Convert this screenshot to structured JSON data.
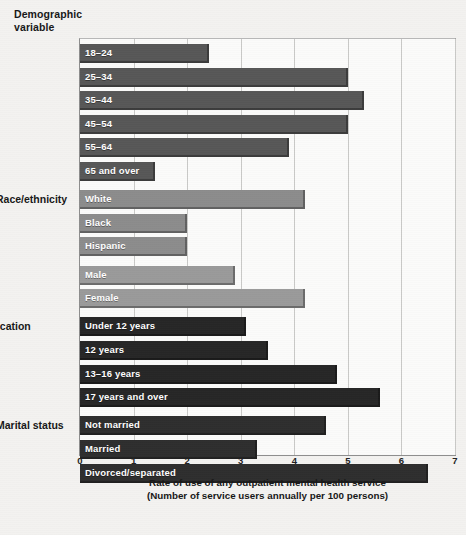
{
  "header": {
    "column_title_line1": "Demographic",
    "column_title_line2": "variable"
  },
  "axis": {
    "title_line1": "Rate of use of any outpatient mental health service",
    "title_line2": "(Number of service users annually per 100 persons)",
    "ticks": [
      "0",
      "1",
      "2",
      "3",
      "4",
      "5",
      "6",
      "7"
    ]
  },
  "groups": [
    {
      "label": "Age"
    },
    {
      "label": "Race/ethnicity"
    },
    {
      "label": "Sex"
    },
    {
      "label": "Education"
    },
    {
      "label": "Marital status"
    }
  ],
  "colors": {
    "age_bar": "#575757",
    "race_bar": "#8c8c8c",
    "sex_bar": "#9a9a9a",
    "education_bar": "#262626",
    "marital_bar": "#2e2e2e",
    "plot_background": "#fbfbfa",
    "page_background": "#f3f2f0",
    "gridline": "#c9c9c7",
    "axis_line": "#8d8d8d",
    "text": "#171717"
  },
  "chart_data": {
    "type": "bar",
    "orientation": "horizontal",
    "title": "",
    "xlabel": "Rate of use of any outpatient mental health service (Number of service users annually per 100 persons)",
    "ylabel": "Demographic variable",
    "xlim": [
      0,
      7
    ],
    "xticks": [
      0,
      1,
      2,
      3,
      4,
      5,
      6,
      7
    ],
    "grid": "vertical",
    "legend": "none",
    "categories": [
      "18–24",
      "25–34",
      "35–44",
      "45–54",
      "55–64",
      "65 and over",
      "White",
      "Black",
      "Hispanic",
      "Male",
      "Female",
      "Under 12 years",
      "12 years",
      "13–16 years",
      "17 years and over",
      "Not married",
      "Married",
      "Divorced/separated"
    ],
    "values": [
      2.4,
      5.0,
      5.3,
      5.0,
      3.9,
      1.4,
      4.2,
      2.0,
      2.0,
      2.9,
      4.2,
      3.1,
      3.5,
      4.8,
      5.6,
      4.6,
      3.3,
      6.5
    ],
    "groups": [
      {
        "label": "Age",
        "color": "#575757",
        "bars": [
          {
            "label": "18–24",
            "value": 2.4
          },
          {
            "label": "25–34",
            "value": 5.0
          },
          {
            "label": "35–44",
            "value": 5.3
          },
          {
            "label": "45–54",
            "value": 5.0
          },
          {
            "label": "55–64",
            "value": 3.9
          },
          {
            "label": "65 and over",
            "value": 1.4
          }
        ]
      },
      {
        "label": "Race/ethnicity",
        "color": "#8c8c8c",
        "bars": [
          {
            "label": "White",
            "value": 4.2
          },
          {
            "label": "Black",
            "value": 2.0
          },
          {
            "label": "Hispanic",
            "value": 2.0
          }
        ]
      },
      {
        "label": "Sex",
        "color": "#9a9a9a",
        "bars": [
          {
            "label": "Male",
            "value": 2.9
          },
          {
            "label": "Female",
            "value": 4.2
          }
        ]
      },
      {
        "label": "Education",
        "color": "#262626",
        "bars": [
          {
            "label": "Under 12 years",
            "value": 3.1
          },
          {
            "label": "12 years",
            "value": 3.5
          },
          {
            "label": "13–16 years",
            "value": 4.8
          },
          {
            "label": "17 years and over",
            "value": 5.6
          }
        ]
      },
      {
        "label": "Marital status",
        "color": "#2e2e2e",
        "bars": [
          {
            "label": "Not married",
            "value": 4.6
          },
          {
            "label": "Married",
            "value": 3.3
          },
          {
            "label": "Divorced/separated",
            "value": 6.5
          }
        ]
      }
    ]
  }
}
